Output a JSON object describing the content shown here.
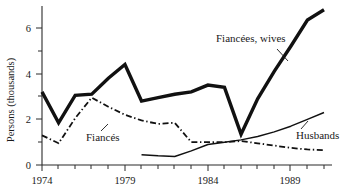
{
  "chart_data": {
    "type": "line",
    "title": "",
    "xlabel": "",
    "ylabel": "Persons (thousands)",
    "xlim": [
      1974,
      1991
    ],
    "ylim": [
      0,
      7
    ],
    "grid": false,
    "legend_position": "inline-annotations",
    "xticks": [
      1974,
      1975,
      1976,
      1977,
      1978,
      1979,
      1980,
      1981,
      1982,
      1983,
      1984,
      1985,
      1986,
      1987,
      1988,
      1989,
      1990,
      1991
    ],
    "xtick_labels": [
      "1974",
      "",
      "",
      "",
      "",
      "1979",
      "",
      "",
      "",
      "",
      "1984",
      "",
      "",
      "",
      "",
      "1989",
      "",
      ""
    ],
    "yticks": [
      0,
      1,
      2,
      3,
      4,
      5,
      6
    ],
    "ytick_labels": [
      "0",
      "",
      "2",
      "",
      "4",
      "",
      "6"
    ],
    "series": [
      {
        "name": "Fiancées, wives",
        "style": "thick-solid",
        "color": "#111111",
        "x": [
          1974,
          1975,
          1976,
          1977,
          1978,
          1979,
          1980,
          1981,
          1982,
          1983,
          1984,
          1985,
          1986,
          1987,
          1988,
          1989,
          1990,
          1991
        ],
        "values": [
          3.2,
          1.85,
          3.05,
          3.1,
          3.8,
          4.4,
          2.8,
          2.95,
          3.1,
          3.2,
          3.5,
          3.4,
          1.35,
          2.9,
          4.1,
          5.2,
          6.35,
          6.8
        ]
      },
      {
        "name": "Fiancés",
        "style": "dash-dot",
        "color": "#111111",
        "x": [
          1974,
          1975,
          1976,
          1977,
          1978,
          1979,
          1980,
          1981,
          1982,
          1983,
          1984,
          1985,
          1986,
          1987,
          1988,
          1989,
          1990,
          1991
        ],
        "values": [
          1.3,
          0.95,
          2.05,
          2.95,
          2.55,
          2.2,
          1.95,
          1.8,
          1.85,
          1.0,
          1.0,
          1.0,
          1.05,
          0.95,
          0.85,
          0.75,
          0.68,
          0.65
        ]
      },
      {
        "name": "Husbands",
        "style": "thin-solid",
        "color": "#111111",
        "x": [
          1980,
          1981,
          1982,
          1983,
          1984,
          1985,
          1986,
          1987,
          1988,
          1989,
          1990,
          1991
        ],
        "values": [
          0.45,
          0.4,
          0.37,
          0.62,
          0.9,
          1.0,
          1.1,
          1.25,
          1.45,
          1.7,
          2.0,
          2.3
        ]
      }
    ],
    "annotations": [
      {
        "label": "Fiancées, wives",
        "x_px": 216,
        "y_px": 42
      },
      {
        "label": "Fiancés",
        "x_px": 86,
        "y_px": 141
      },
      {
        "label": "Husbands",
        "x_px": 296,
        "y_px": 135
      }
    ]
  }
}
